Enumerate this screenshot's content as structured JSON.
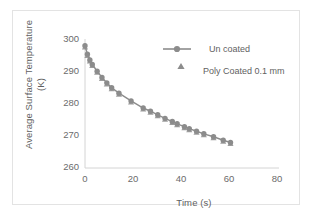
{
  "figure": {
    "background": "#ffffff",
    "border_color": "#e3e3e3"
  },
  "chart_data": {
    "type": "line",
    "title": "",
    "xlabel": "Time (s)",
    "ylabel": "Average Surface Temperature (K)",
    "ylabel_line1": "Average Surface Temperature",
    "ylabel_line2": "(K)",
    "xlim": [
      0,
      80
    ],
    "ylim": [
      260,
      300
    ],
    "xticks": [
      0,
      20,
      40,
      60,
      80
    ],
    "yticks": [
      260,
      270,
      280,
      290,
      300
    ],
    "grid": false,
    "legend_position": "top-right",
    "series_color": "#8c8c8c",
    "series": [
      {
        "name": "Un coated",
        "marker": "circle",
        "line": true,
        "x": [
          0,
          1,
          2,
          3,
          5,
          7,
          9,
          11,
          14,
          19,
          24,
          27,
          30,
          33,
          36,
          38,
          41,
          43,
          46,
          49,
          53,
          57,
          60
        ],
        "values": [
          297.9,
          295.3,
          293.5,
          292.1,
          290.0,
          288.1,
          286.4,
          284.9,
          283.2,
          280.8,
          278.6,
          277.6,
          276.5,
          275.4,
          274.4,
          273.7,
          272.8,
          272.2,
          271.4,
          270.6,
          269.7,
          268.6,
          267.9
        ]
      },
      {
        "name": "Poly Coated 0.1 mm",
        "marker": "triangle",
        "line": false,
        "x": [
          0,
          1,
          2,
          3,
          5,
          7,
          9,
          11,
          14,
          19,
          24,
          27,
          30,
          33,
          36,
          38,
          41,
          43,
          46,
          49,
          53,
          57,
          60
        ],
        "values": [
          297.5,
          294.9,
          293.2,
          291.8,
          289.7,
          287.8,
          286.1,
          284.6,
          282.9,
          280.5,
          278.3,
          277.3,
          276.2,
          275.1,
          274.1,
          273.4,
          272.5,
          271.9,
          271.1,
          270.3,
          269.4,
          268.3,
          267.6
        ]
      }
    ]
  },
  "legend": {
    "items": [
      {
        "label": "Un coated",
        "marker": "circle-with-line"
      },
      {
        "label": "Poly Coated 0.1 mm",
        "marker": "triangle"
      }
    ]
  }
}
